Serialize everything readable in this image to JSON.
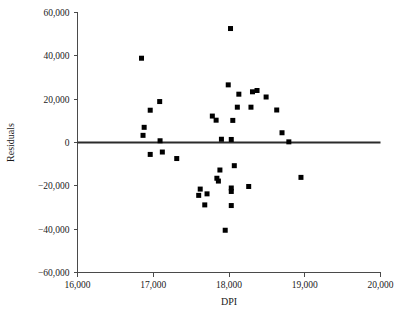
{
  "chart_data": {
    "type": "scatter",
    "title": "",
    "xlabel": "DPI",
    "ylabel": "Residuals",
    "xlim": [
      16000,
      20000
    ],
    "ylim": [
      -60000,
      60000
    ],
    "xticks": [
      16000,
      17000,
      18000,
      19000,
      20000
    ],
    "yticks": [
      60000,
      40000,
      20000,
      0,
      -20000,
      -40000,
      -60000
    ],
    "xtick_labels": [
      "16,000",
      "17,000",
      "18,000",
      "19,000",
      "20,000"
    ],
    "ytick_labels": [
      "60,000",
      "40,000",
      "20,000",
      "0",
      "−20,000",
      "−40,000",
      "−60,000"
    ],
    "grid": false,
    "legend": null,
    "reference_line": {
      "name": "zero-residual-line",
      "type": "horizontal",
      "y": 0,
      "x_start": 16000,
      "x_end": 20000
    },
    "marker": {
      "shape": "square",
      "size": 5,
      "color": "#000000"
    },
    "points": [
      {
        "x": 16845,
        "y": 38900
      },
      {
        "x": 16960,
        "y": 14900
      },
      {
        "x": 17085,
        "y": 18900
      },
      {
        "x": 16880,
        "y": 7000
      },
      {
        "x": 16865,
        "y": 3300
      },
      {
        "x": 17090,
        "y": 800
      },
      {
        "x": 16960,
        "y": -5500
      },
      {
        "x": 17120,
        "y": -4400
      },
      {
        "x": 17310,
        "y": -7400
      },
      {
        "x": 18020,
        "y": 52600
      },
      {
        "x": 17990,
        "y": 26600
      },
      {
        "x": 18130,
        "y": 22300
      },
      {
        "x": 18310,
        "y": 23400
      },
      {
        "x": 18370,
        "y": 24000
      },
      {
        "x": 18490,
        "y": 21000
      },
      {
        "x": 18110,
        "y": 16300
      },
      {
        "x": 18290,
        "y": 16300
      },
      {
        "x": 18630,
        "y": 15000
      },
      {
        "x": 17780,
        "y": 12200
      },
      {
        "x": 17830,
        "y": 10300
      },
      {
        "x": 18050,
        "y": 10200
      },
      {
        "x": 18700,
        "y": 4500
      },
      {
        "x": 17900,
        "y": 1500
      },
      {
        "x": 18030,
        "y": 1400
      },
      {
        "x": 18790,
        "y": 300
      },
      {
        "x": 18070,
        "y": -10700
      },
      {
        "x": 17880,
        "y": -12700
      },
      {
        "x": 17840,
        "y": -16500
      },
      {
        "x": 17860,
        "y": -17800
      },
      {
        "x": 18030,
        "y": -21000
      },
      {
        "x": 18030,
        "y": -22600
      },
      {
        "x": 17620,
        "y": -21500
      },
      {
        "x": 17600,
        "y": -24400
      },
      {
        "x": 17710,
        "y": -23700
      },
      {
        "x": 18260,
        "y": -20300
      },
      {
        "x": 18950,
        "y": -16100
      },
      {
        "x": 17680,
        "y": -28800
      },
      {
        "x": 18030,
        "y": -29100
      },
      {
        "x": 17950,
        "y": -40500
      }
    ]
  },
  "axes": {
    "x_axis_name": "dpi-axis",
    "y_axis_name": "residuals-axis"
  }
}
